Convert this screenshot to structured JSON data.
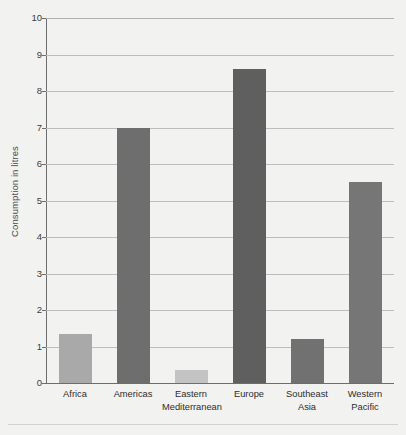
{
  "chart_data": {
    "type": "bar",
    "title": "",
    "xlabel": "",
    "ylabel": "Consumption in litres",
    "categories": [
      "Africa",
      "Eastern Mediterranean",
      "Americas",
      "Europe",
      "Southeast Asia",
      "Western Pacific"
    ],
    "category_lines": [
      [
        "Africa",
        ""
      ],
      [
        "Americas",
        ""
      ],
      [
        "Eastern",
        "Mediterranean"
      ],
      [
        "Europe",
        ""
      ],
      [
        "Southeast",
        "Asia"
      ],
      [
        "Western",
        "Pacific"
      ]
    ],
    "ordered_categories": [
      "Africa",
      "Americas",
      "Eastern Mediterranean",
      "Europe",
      "Southeast Asia",
      "Western Pacific"
    ],
    "values": [
      1.35,
      7.0,
      0.35,
      8.6,
      1.2,
      5.5
    ],
    "bar_colors": [
      "#a9a9a9",
      "#6e6e6e",
      "#c3c3c3",
      "#5f5f5f",
      "#717171",
      "#767676"
    ],
    "ylim": [
      0,
      10
    ],
    "ytick_labels": [
      "0",
      "1",
      "2",
      "3",
      "4",
      "5",
      "6",
      "7",
      "8",
      "9",
      "10"
    ],
    "ytick_values": [
      0,
      1,
      2,
      3,
      4,
      5,
      6,
      7,
      8,
      9,
      10
    ],
    "grid": true,
    "legend": "none",
    "background_color": "#f2f2f0",
    "gridline_color": "#b0b0b0",
    "axis_color": "#6d6d6d"
  }
}
